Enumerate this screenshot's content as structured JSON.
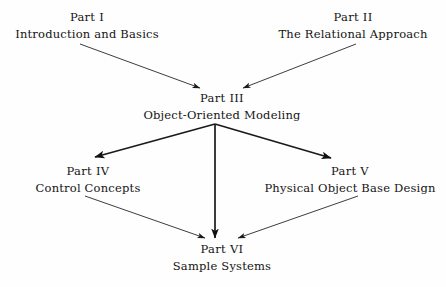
{
  "diagram": {
    "type": "flow-diagram",
    "background_color": "#fefefe",
    "line_color": "#1a1a1a",
    "text_color": "#141414",
    "nodes": [
      {
        "id": "part-i",
        "part": "Part I",
        "title": "Introduction and Basics",
        "center_x": 87,
        "part_y": 12,
        "title_y": 29
      },
      {
        "id": "part-ii",
        "part": "Part II",
        "title": "The Relational Approach",
        "center_x": 353,
        "part_y": 12,
        "title_y": 29
      },
      {
        "id": "part-iii",
        "part": "Part III",
        "title": "Object-Oriented Modeling",
        "center_x": 222,
        "part_y": 93,
        "title_y": 110
      },
      {
        "id": "part-iv",
        "part": "Part IV",
        "title": "Control Concepts",
        "center_x": 88,
        "part_y": 166,
        "title_y": 183
      },
      {
        "id": "part-v",
        "part": "Part V",
        "title": "Physical Object Base Design",
        "center_x": 350,
        "part_y": 166,
        "title_y": 183
      },
      {
        "id": "part-vi",
        "part": "Part VI",
        "title": "Sample Systems",
        "center_x": 222,
        "part_y": 244,
        "title_y": 261
      }
    ],
    "edges": [
      {
        "id": "edge-part-i-to-part-iii",
        "from": "part-i",
        "to": "part-iii",
        "x1": 80,
        "y1": 44,
        "x2": 200,
        "y2": 88,
        "weight": "thin"
      },
      {
        "id": "edge-part-ii-to-part-iii",
        "from": "part-ii",
        "to": "part-iii",
        "x1": 356,
        "y1": 44,
        "x2": 243,
        "y2": 88,
        "weight": "thin"
      },
      {
        "id": "edge-part-iii-to-part-iv",
        "from": "part-iii",
        "to": "part-iv",
        "x1": 215,
        "y1": 124,
        "x2": 95,
        "y2": 157,
        "weight": "thick"
      },
      {
        "id": "edge-part-iii-to-part-v",
        "from": "part-iii",
        "to": "part-v",
        "x1": 215,
        "y1": 124,
        "x2": 331,
        "y2": 158,
        "weight": "thick"
      },
      {
        "id": "edge-part-iii-to-part-vi",
        "from": "part-iii",
        "to": "part-vi",
        "x1": 215,
        "y1": 124,
        "x2": 215,
        "y2": 238,
        "weight": "thick"
      },
      {
        "id": "edge-part-iv-to-part-vi",
        "from": "part-iv",
        "to": "part-vi",
        "x1": 85,
        "y1": 196,
        "x2": 205,
        "y2": 238,
        "weight": "thin"
      },
      {
        "id": "edge-part-v-to-part-vi",
        "from": "part-v",
        "to": "part-vi",
        "x1": 358,
        "y1": 196,
        "x2": 238,
        "y2": 238,
        "weight": "thin"
      }
    ]
  }
}
